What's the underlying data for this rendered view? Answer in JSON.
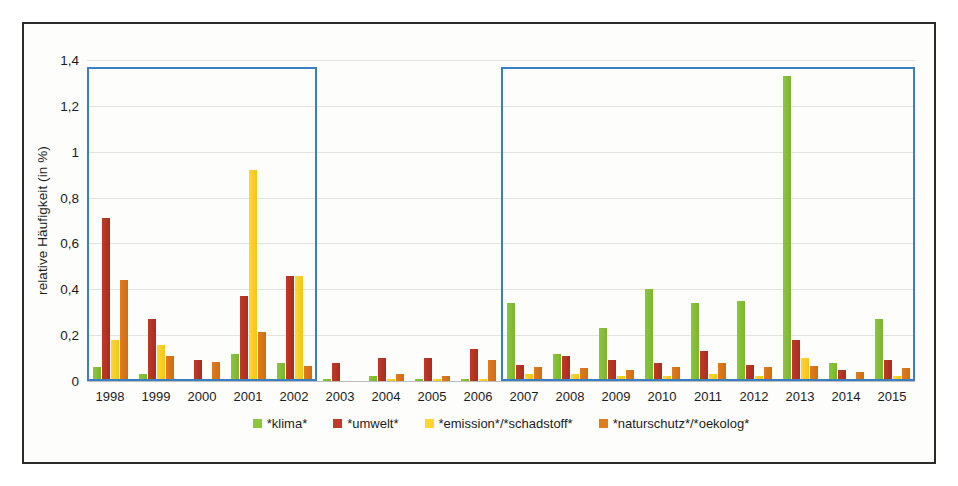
{
  "chart_data": {
    "type": "bar",
    "title": "",
    "xlabel": "",
    "ylabel": "relative Häufigkeit (in %)",
    "ylim": [
      0,
      1.4
    ],
    "ytick_labels": [
      "0",
      "0,2",
      "0,4",
      "0,6",
      "0,8",
      "1",
      "1,2",
      "1,4"
    ],
    "ytick_values": [
      0,
      0.2,
      0.4,
      0.6,
      0.8,
      1.0,
      1.2,
      1.4
    ],
    "grid": true,
    "legend_position": "bottom",
    "categories": [
      "1998",
      "1999",
      "2000",
      "2001",
      "2002",
      "2003",
      "2004",
      "2005",
      "2006",
      "2007",
      "2008",
      "2009",
      "2010",
      "2011",
      "2012",
      "2013",
      "2014",
      "2015"
    ],
    "series": [
      {
        "name": "*klima*",
        "color": "#8cc63e",
        "values": [
          0.06,
          0.03,
          0.01,
          0.12,
          0.08,
          0.01,
          0.02,
          0.01,
          0.01,
          0.34,
          0.12,
          0.23,
          0.4,
          0.34,
          0.35,
          1.33,
          0.08,
          0.27
        ]
      },
      {
        "name": "*umwelt*",
        "color": "#c0392b",
        "values": [
          0.71,
          0.27,
          0.09,
          0.37,
          0.46,
          0.08,
          0.1,
          0.1,
          0.14,
          0.07,
          0.11,
          0.09,
          0.08,
          0.13,
          0.07,
          0.18,
          0.05,
          0.09
        ]
      },
      {
        "name": "*emission*/*schadstoff*",
        "color": "#ffd633",
        "values": [
          0.18,
          0.155,
          0.01,
          0.92,
          0.46,
          0.0,
          0.01,
          0.01,
          0.01,
          0.03,
          0.03,
          0.02,
          0.02,
          0.03,
          0.02,
          0.1,
          0.0,
          0.02
        ]
      },
      {
        "name": "*naturschutz*/*oekolog*",
        "color": "#e07b1e",
        "values": [
          0.44,
          0.11,
          0.085,
          0.215,
          0.065,
          0.0,
          0.03,
          0.02,
          0.09,
          0.06,
          0.055,
          0.05,
          0.06,
          0.08,
          0.06,
          0.065,
          0.04,
          0.055
        ]
      }
    ],
    "annotations": [
      {
        "name": "highlight-box-left",
        "type": "rectangle",
        "color": "#3a7fc1",
        "x_from": "1998",
        "x_to": "2002",
        "y_from": 0,
        "y_to": 1.37
      },
      {
        "name": "highlight-box-right",
        "type": "rectangle",
        "color": "#3a7fc1",
        "x_from": "2007",
        "x_to": "2015",
        "y_from": 0,
        "y_to": 1.37
      }
    ]
  },
  "legend": {
    "items": [
      {
        "label": "*klima*",
        "color": "#8cc63e"
      },
      {
        "label": "*umwelt*",
        "color": "#c0392b"
      },
      {
        "label": "*emission*/*schadstoff*",
        "color": "#ffd633"
      },
      {
        "label": "*naturschutz*/*oekolog*",
        "color": "#e07b1e"
      }
    ]
  }
}
